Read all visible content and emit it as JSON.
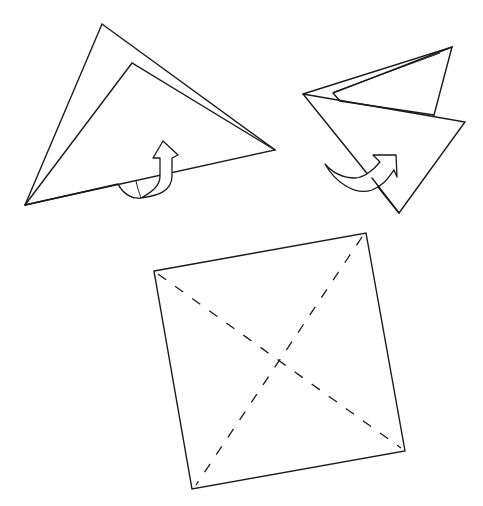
{
  "diagram": {
    "type": "origami-instructions",
    "steps": [
      {
        "id": "step-fold-triangle-left",
        "description": "Folded triangle with arrow indicating fold behind",
        "shape": "triangle",
        "arrow": "curved-arrow-up"
      },
      {
        "id": "step-fold-triangle-right",
        "description": "Rotated folded triangle with arrow indicating fold over",
        "shape": "triangle",
        "arrow": "curved-arrow-right"
      },
      {
        "id": "step-square-creases",
        "description": "Square with diagonal dashed crease lines",
        "shape": "square",
        "creases": [
          "diagonal-tl-br",
          "diagonal-tr-bl"
        ],
        "crease_style": "dashed"
      }
    ],
    "colors": {
      "stroke": "#1a1a1a",
      "background": "#ffffff"
    }
  }
}
